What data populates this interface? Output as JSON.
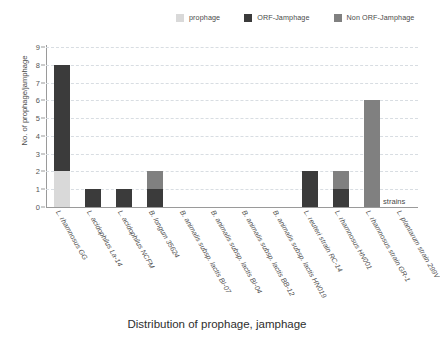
{
  "chart_data": {
    "type": "bar",
    "title": "",
    "caption": "Distribution of prophage, jamphage",
    "xlabel": "strains",
    "ylabel": "No. of prophage/jamphage",
    "ylim": [
      0,
      9
    ],
    "yticks": [
      0,
      1,
      2,
      3,
      4,
      5,
      6,
      7,
      8,
      9
    ],
    "grid": true,
    "stacked": true,
    "legend_position": "top-right",
    "categories": [
      "L. rhamnosus GG",
      "L. acidophilus La-14",
      "L. acidophilus NCFM",
      "B. longum 35624",
      "B. animalis subsp. lactis BI-07",
      "B. animalis subsp. lactis BI-04",
      "B. animalis subsp. lactis BB-12",
      "B. animalis subsp. lactis HN019",
      "L. reuteri strain RC-14",
      "L. rhamnosus HN001",
      "L. rhamnosus strain GR-1",
      "L. plantarum strain 299V"
    ],
    "series": [
      {
        "name": "prophage",
        "color": "#d9d9d9",
        "values": [
          2,
          0,
          0,
          0,
          0,
          0,
          0,
          0,
          0,
          0,
          0,
          0
        ]
      },
      {
        "name": "ORF-Jamphage",
        "color": "#3b3b3b",
        "values": [
          6,
          1,
          1,
          1,
          0,
          0,
          0,
          0,
          2,
          1,
          0,
          0
        ]
      },
      {
        "name": "Non ORF-Jamphage",
        "color": "#808080",
        "values": [
          0,
          0,
          0,
          1,
          0,
          0,
          0,
          0,
          0,
          1,
          6,
          0
        ]
      }
    ],
    "totals": [
      8,
      1,
      1,
      2,
      0,
      0,
      0,
      0,
      2,
      2,
      6,
      0
    ]
  }
}
